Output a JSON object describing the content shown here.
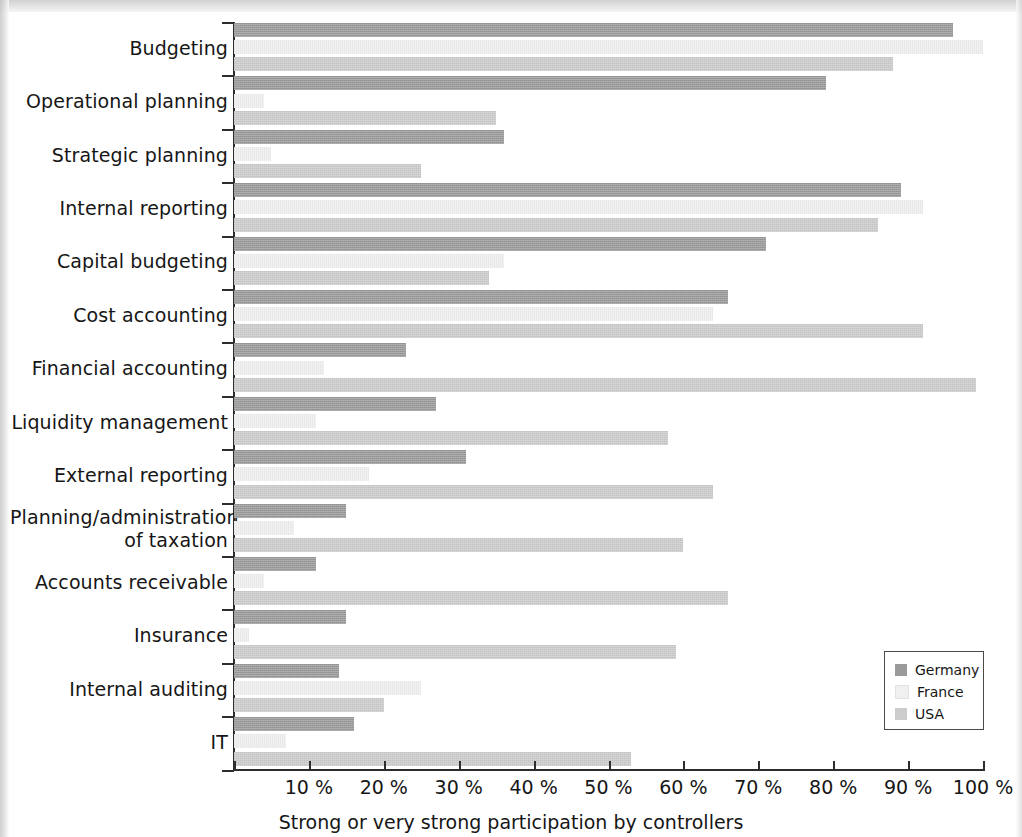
{
  "chart_data": {
    "type": "bar",
    "orientation": "horizontal",
    "title": "",
    "xlabel": "Strong or very strong participation by controllers",
    "ylabel": "",
    "xlim": [
      0,
      100
    ],
    "grid": false,
    "legend_position": "bottom-right",
    "x_tick_labels": [
      "10 %",
      "20 %",
      "30 %",
      "40 %",
      "50 %",
      "60 %",
      "70 %",
      "80 %",
      "90 %",
      "100 %"
    ],
    "x_tick_values": [
      10,
      20,
      30,
      40,
      50,
      60,
      70,
      80,
      90,
      100
    ],
    "categories": [
      "Budgeting",
      "Operational planning",
      "Strategic planning",
      "Internal reporting",
      "Capital budgeting",
      "Cost accounting",
      "Financial accounting",
      "Liquidity management",
      "External reporting",
      "Planning/administration of taxation",
      "Accounts receivable",
      "Insurance",
      "Internal auditing",
      "IT"
    ],
    "series": [
      {
        "name": "Germany",
        "color": "#9a9a9a",
        "values": [
          96,
          79,
          36,
          89,
          71,
          66,
          23,
          27,
          31,
          15,
          11,
          15,
          14,
          16
        ]
      },
      {
        "name": "France",
        "color": "#f0f0f0",
        "values": [
          100,
          4,
          5,
          92,
          36,
          64,
          12,
          11,
          18,
          8,
          4,
          2,
          25,
          7
        ]
      },
      {
        "name": "USA",
        "color": "#cccccc",
        "values": [
          88,
          35,
          25,
          86,
          34,
          92,
          99,
          58,
          64,
          60,
          66,
          59,
          20,
          53
        ]
      }
    ]
  },
  "legend": {
    "items": [
      {
        "label": "Germany",
        "color": "#9a9a9a"
      },
      {
        "label": "France",
        "color": "#f0f0f0"
      },
      {
        "label": "USA",
        "color": "#cccccc"
      }
    ]
  },
  "axis": {
    "x_title": "Strong or very strong participation by controllers"
  },
  "category_labels": [
    {
      "line1": "Budgeting",
      "line2": ""
    },
    {
      "line1": "Operational planning",
      "line2": ""
    },
    {
      "line1": "Strategic planning",
      "line2": ""
    },
    {
      "line1": "Internal reporting",
      "line2": ""
    },
    {
      "line1": "Capital budgeting",
      "line2": ""
    },
    {
      "line1": "Cost accounting",
      "line2": ""
    },
    {
      "line1": "Financial accounting",
      "line2": ""
    },
    {
      "line1": "Liquidity management",
      "line2": ""
    },
    {
      "line1": "External reporting",
      "line2": ""
    },
    {
      "line1": "Planning/administration",
      "line2": "of taxation"
    },
    {
      "line1": "Accounts receivable",
      "line2": ""
    },
    {
      "line1": "Insurance",
      "line2": ""
    },
    {
      "line1": "Internal auditing",
      "line2": ""
    },
    {
      "line1": "IT",
      "line2": ""
    }
  ]
}
